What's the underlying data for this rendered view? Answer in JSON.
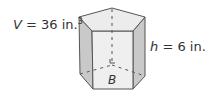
{
  "diagram": {
    "shape": "pentagonal prism",
    "volume_label": {
      "var": "V",
      "eq": " = 36 in.",
      "exp": "3"
    },
    "height_label": {
      "var": "h",
      "eq": " = 6 in."
    },
    "base_label": "B",
    "colors": {
      "edge": "#555555",
      "top_face": "#ececec",
      "side_face": "#c9c9c9",
      "front_face": "#efefef",
      "bottom_face": "#e4e4e4"
    }
  }
}
